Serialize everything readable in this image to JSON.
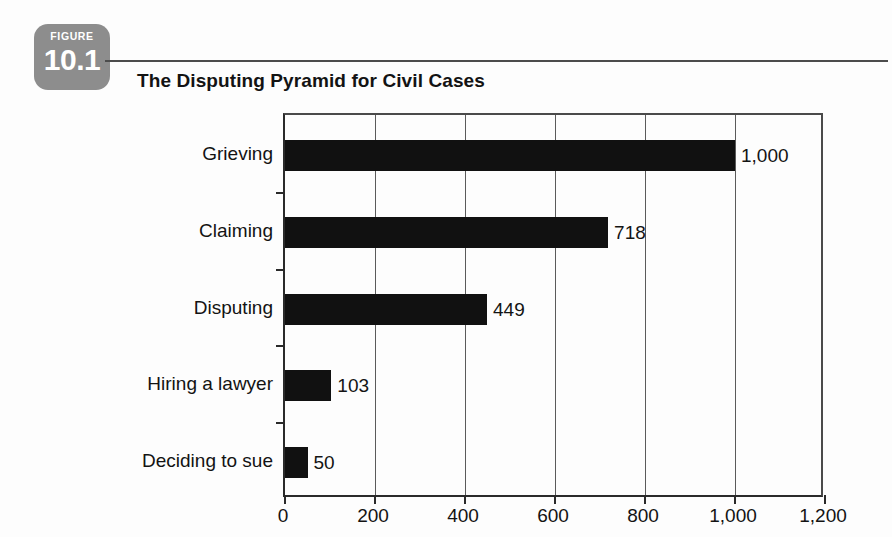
{
  "figure": {
    "kicker": "FIGURE",
    "number": "10.1",
    "badge_color": "#8d8d8d"
  },
  "title": "The Disputing Pyramid for Civil Cases",
  "chart_data": {
    "type": "bar",
    "orientation": "horizontal",
    "title": "The Disputing Pyramid for Civil Cases",
    "categories": [
      "Grieving",
      "Claiming",
      "Disputing",
      "Hiring a lawyer",
      "Deciding to sue"
    ],
    "values": [
      1000,
      718,
      449,
      103,
      50
    ],
    "value_labels": [
      "1,000",
      "718",
      "449",
      "103",
      "50"
    ],
    "xlabel": "",
    "ylabel": "",
    "xlim": [
      0,
      1200
    ],
    "xticks": [
      0,
      200,
      400,
      600,
      800,
      1000,
      1200
    ],
    "xtick_labels": [
      "0",
      "200",
      "400",
      "600",
      "800",
      "1,000",
      "1,200"
    ],
    "grid": "vertical",
    "legend": "none",
    "bar_color": "#111111"
  }
}
